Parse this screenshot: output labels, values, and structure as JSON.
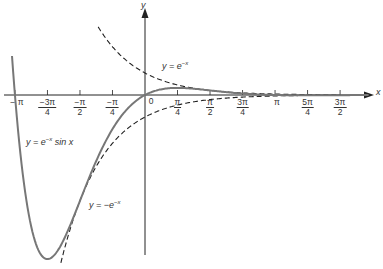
{
  "chart_data": {
    "type": "line",
    "title": "",
    "xlabel": "x",
    "ylabel": "y",
    "grid": false,
    "xlim": [
      -3.35,
      5.4
    ],
    "ylim": [
      -7.5,
      4.0
    ],
    "x_ticks": [
      {
        "value": -3.1416,
        "label": "-π",
        "num": "",
        "den": ""
      },
      {
        "value": -2.3562,
        "label": "-3π/4",
        "num": "−3π",
        "den": "4"
      },
      {
        "value": -1.5708,
        "label": "-π/2",
        "num": "−π",
        "den": "2"
      },
      {
        "value": -0.7854,
        "label": "-π/4",
        "num": "−π",
        "den": "4"
      },
      {
        "value": 0,
        "label": "0",
        "num": "",
        "den": ""
      },
      {
        "value": 0.7854,
        "label": "π/4",
        "num": "π",
        "den": "4"
      },
      {
        "value": 1.5708,
        "label": "π/2",
        "num": "π",
        "den": "2"
      },
      {
        "value": 2.3562,
        "label": "3π/4",
        "num": "3π",
        "den": "4"
      },
      {
        "value": 3.1416,
        "label": "π",
        "num": "",
        "den": ""
      },
      {
        "value": 3.927,
        "label": "5π/4",
        "num": "5π",
        "den": "4"
      },
      {
        "value": 4.7124,
        "label": "3π/2",
        "num": "3π",
        "den": "2"
      }
    ],
    "series": [
      {
        "name": "y = e^{-x} sin x",
        "style": "solid",
        "color": "#777777",
        "x_range": [
          -3.3,
          5.4
        ],
        "sample_points": [
          [
            -3.1416,
            0
          ],
          [
            -2.3562,
            -7.46
          ],
          [
            -1.5708,
            -4.81
          ],
          [
            -0.7854,
            -1.55
          ],
          [
            0,
            0
          ],
          [
            0.7854,
            0.322
          ],
          [
            1.5708,
            0.208
          ],
          [
            2.3562,
            0.067
          ],
          [
            3.1416,
            0
          ],
          [
            3.927,
            -0.014
          ],
          [
            4.7124,
            -0.009
          ]
        ]
      },
      {
        "name": "y = e^{-x}",
        "style": "dashed",
        "color": "#222222",
        "x_range": [
          -1.13,
          4.72
        ],
        "sample_points": [
          [
            -1.13,
            3.1
          ],
          [
            0,
            1
          ],
          [
            0.7854,
            0.456
          ],
          [
            1.5708,
            0.208
          ],
          [
            3.1416,
            0.043
          ],
          [
            4.7124,
            0.009
          ]
        ]
      },
      {
        "name": "y = -e^{-x}",
        "style": "dashed",
        "color": "#222222",
        "x_range": [
          -2.1,
          4.72
        ],
        "sample_points": [
          [
            -2.1,
            -8.17
          ],
          [
            -1.5708,
            -4.81
          ],
          [
            0,
            -1
          ],
          [
            0.7854,
            -0.456
          ],
          [
            1.5708,
            -0.208
          ],
          [
            3.1416,
            -0.043
          ],
          [
            4.7124,
            -0.009
          ]
        ]
      }
    ],
    "annotations": [
      {
        "text": "y = e^{−x}",
        "near": "upper dashed curve"
      },
      {
        "text": "y = e^{−x} sin x",
        "near": "left solid curve"
      },
      {
        "text": "y = −e^{−x}",
        "near": "lower dashed curve"
      }
    ]
  },
  "labels": {
    "x_axis": "x",
    "y_axis": "y",
    "upper_curve": "y = e",
    "upper_curve_exp": "−x",
    "main_curve": "y = e",
    "main_curve_exp": "−x",
    "main_curve_tail": " sin x",
    "lower_curve": "y = −e",
    "lower_curve_exp": "−x",
    "tick_neg_pi": "− π",
    "tick_zero": "0",
    "tick_pi": "π"
  }
}
